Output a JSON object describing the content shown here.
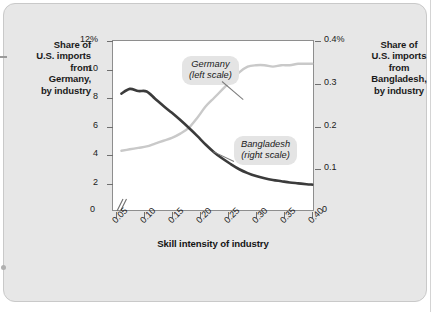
{
  "figure": {
    "left_axis_caption": "Share of\nU.S. imports\nfrom\nGermany,\nby industry",
    "right_axis_caption": "Share of\nU.S. imports\nfrom\nBangladesh,\nby industry",
    "x_axis_title": "Skill intensity of industry",
    "left_zero_label": "0",
    "right_zero_label": "0",
    "callouts": {
      "germany": "Germany\n(left scale)",
      "bangladesh": "Bangladesh\n(right scale)"
    }
  },
  "colors": {
    "panel_background": "#e7e7e7",
    "plot_background": "#ffffff",
    "plot_border": "#8e8e8e",
    "germany_line": "#c9c9c9",
    "bangladesh_line": "#3b3b3b",
    "callout_background": "#e4e4e4",
    "text": "#1a1a1a"
  },
  "chart_data": {
    "type": "line",
    "title": "",
    "subtitle": "",
    "xlabel": "Skill intensity of industry",
    "ylabel": "Share of U.S. imports from Germany, by industry",
    "y2label": "Share of U.S. imports from Bangladesh, by industry",
    "grid": false,
    "legend_position": "inline-callouts",
    "xlim": [
      0.045,
      0.405
    ],
    "ylim": [
      0,
      12
    ],
    "y2lim": [
      0,
      0.4
    ],
    "axis_break": true,
    "x_ticks": [
      0.05,
      0.1,
      0.15,
      0.2,
      0.25,
      0.3,
      0.35,
      0.4
    ],
    "x_tick_labels": [
      "0.05",
      "0.10",
      "0.15",
      "0.20",
      "0.25",
      "0.30",
      "0.35",
      "0.40"
    ],
    "y_ticks": [
      2,
      4,
      6,
      8,
      10,
      12
    ],
    "y_tick_labels": [
      "2",
      "4",
      "6",
      "8",
      "10",
      "12%"
    ],
    "y2_ticks": [
      0.1,
      0.2,
      0.3,
      0.4
    ],
    "y2_tick_labels": [
      "0.1",
      "0.2",
      "0.3",
      "0.4%"
    ],
    "series": [
      {
        "name": "Germany",
        "axis": "left",
        "scale_note": "(left scale)",
        "color": "#c9c9c9",
        "x": [
          0.06,
          0.075,
          0.09,
          0.105,
          0.12,
          0.135,
          0.15,
          0.165,
          0.18,
          0.195,
          0.21,
          0.225,
          0.24,
          0.255,
          0.27,
          0.285,
          0.3,
          0.315,
          0.33,
          0.345,
          0.36,
          0.375,
          0.39,
          0.4
        ],
        "values": [
          4.3,
          4.4,
          4.5,
          4.6,
          4.8,
          5.0,
          5.2,
          5.5,
          5.9,
          6.6,
          7.4,
          8.0,
          8.6,
          9.2,
          9.8,
          10.2,
          10.3,
          10.3,
          10.2,
          10.3,
          10.3,
          10.4,
          10.4,
          10.4
        ]
      },
      {
        "name": "Bangladesh",
        "axis": "right",
        "scale_note": "(right scale)",
        "color": "#3b3b3b",
        "x": [
          0.06,
          0.075,
          0.09,
          0.105,
          0.12,
          0.135,
          0.15,
          0.165,
          0.18,
          0.195,
          0.21,
          0.225,
          0.24,
          0.255,
          0.27,
          0.285,
          0.3,
          0.315,
          0.33,
          0.345,
          0.36,
          0.375,
          0.39,
          0.4
        ],
        "values": [
          0.277,
          0.288,
          0.283,
          0.282,
          0.265,
          0.248,
          0.232,
          0.215,
          0.197,
          0.178,
          0.158,
          0.14,
          0.125,
          0.112,
          0.1,
          0.091,
          0.084,
          0.079,
          0.075,
          0.072,
          0.069,
          0.067,
          0.065,
          0.064
        ]
      }
    ]
  }
}
